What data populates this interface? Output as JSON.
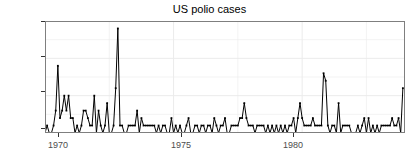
{
  "chart": {
    "title": "US polio cases",
    "ylabel": "Counts per month",
    "xlabel": "",
    "ytick_labels": [
      "0",
      "5",
      "10",
      "15"
    ],
    "xtick_labels": [
      "1970",
      "1975",
      "1980"
    ]
  },
  "colors": {
    "point": "#000000",
    "line": "#000000",
    "panel_background": "#ffffff",
    "gridline": "#ebebeb",
    "panel_border": "#7f7f7f",
    "axis_text": "#4d4d4d",
    "title_text": "#000000"
  },
  "chart_data": {
    "type": "line",
    "title": "US polio cases",
    "subtitle": "",
    "xlabel": "",
    "ylabel": "Counts per month",
    "xlim": [
      1970.0,
      1984.0
    ],
    "ylim": [
      0,
      15
    ],
    "xticks": [
      1970,
      1975,
      1980
    ],
    "yticks": [
      0,
      5,
      10,
      15
    ],
    "grid": true,
    "legend": "none",
    "marker": "point",
    "x_unit": "year (monthly resolution)",
    "x": [
      1970.0,
      1970.083,
      1970.167,
      1970.25,
      1970.333,
      1970.417,
      1970.5,
      1970.583,
      1970.667,
      1970.75,
      1970.833,
      1970.917,
      1971.0,
      1971.083,
      1971.167,
      1971.25,
      1971.333,
      1971.417,
      1971.5,
      1971.583,
      1971.667,
      1971.75,
      1971.833,
      1971.917,
      1972.0,
      1972.083,
      1972.167,
      1972.25,
      1972.333,
      1972.417,
      1972.5,
      1972.583,
      1972.667,
      1972.75,
      1972.833,
      1972.917,
      1973.0,
      1973.083,
      1973.167,
      1973.25,
      1973.333,
      1973.417,
      1973.5,
      1973.583,
      1973.667,
      1973.75,
      1973.833,
      1973.917,
      1974.0,
      1974.083,
      1974.167,
      1974.25,
      1974.333,
      1974.417,
      1974.5,
      1974.583,
      1974.667,
      1974.75,
      1974.833,
      1974.917,
      1975.0,
      1975.083,
      1975.167,
      1975.25,
      1975.333,
      1975.417,
      1975.5,
      1975.583,
      1975.667,
      1975.75,
      1975.833,
      1975.917,
      1976.0,
      1976.083,
      1976.167,
      1976.25,
      1976.333,
      1976.417,
      1976.5,
      1976.583,
      1976.667,
      1976.75,
      1976.833,
      1976.917,
      1977.0,
      1977.083,
      1977.167,
      1977.25,
      1977.333,
      1977.417,
      1977.5,
      1977.583,
      1977.667,
      1977.75,
      1977.833,
      1977.917,
      1978.0,
      1978.083,
      1978.167,
      1978.25,
      1978.333,
      1978.417,
      1978.5,
      1978.583,
      1978.667,
      1978.75,
      1978.833,
      1978.917,
      1979.0,
      1979.083,
      1979.167,
      1979.25,
      1979.333,
      1979.417,
      1979.5,
      1979.583,
      1979.667,
      1979.75,
      1979.833,
      1979.917,
      1980.0,
      1980.083,
      1980.167,
      1980.25,
      1980.333,
      1980.417,
      1980.5,
      1980.583,
      1980.667,
      1980.75,
      1980.833,
      1980.917,
      1981.0,
      1981.083,
      1981.167,
      1981.25,
      1981.333,
      1981.417,
      1981.5,
      1981.583,
      1981.667,
      1981.75,
      1981.833,
      1981.917,
      1982.0,
      1982.083,
      1982.167,
      1982.25,
      1982.333,
      1982.417,
      1982.5,
      1982.583,
      1982.667,
      1982.75,
      1982.833,
      1982.917,
      1983.0,
      1983.083,
      1983.167,
      1983.25,
      1983.333,
      1983.417,
      1983.5,
      1983.583,
      1983.667,
      1983.75,
      1983.833,
      1983.917
    ],
    "values": [
      0,
      1,
      0,
      0,
      1,
      3,
      9,
      2,
      3,
      5,
      3,
      5,
      2,
      2,
      0,
      1,
      0,
      1,
      3,
      3,
      2,
      1,
      1,
      5,
      0,
      3,
      1,
      0,
      1,
      4,
      0,
      0,
      1,
      6,
      14,
      1,
      1,
      0,
      0,
      1,
      1,
      1,
      1,
      3,
      0,
      2,
      1,
      1,
      1,
      1,
      1,
      1,
      0,
      1,
      0,
      1,
      1,
      0,
      0,
      2,
      0,
      1,
      0,
      1,
      0,
      0,
      1,
      2,
      0,
      0,
      1,
      1,
      0,
      1,
      1,
      0,
      1,
      1,
      0,
      2,
      1,
      0,
      1,
      1,
      2,
      0,
      0,
      1,
      1,
      1,
      1,
      2,
      2,
      4,
      2,
      1,
      1,
      1,
      0,
      1,
      1,
      1,
      1,
      0,
      1,
      0,
      1,
      0,
      1,
      0,
      1,
      0,
      1,
      0,
      1,
      1,
      2,
      0,
      2,
      4,
      2,
      1,
      1,
      1,
      1,
      2,
      1,
      1,
      1,
      1,
      8,
      7,
      1,
      0,
      1,
      1,
      0,
      4,
      0,
      1,
      1,
      1,
      1,
      0,
      0,
      0,
      1,
      0,
      1,
      2,
      0,
      2,
      0,
      1,
      0,
      1,
      0,
      1,
      1,
      1,
      1,
      1,
      2,
      1,
      1,
      2,
      0,
      6
    ],
    "series": [
      {
        "name": "Counts per month",
        "draw": [
          "line",
          "points"
        ]
      }
    ]
  }
}
